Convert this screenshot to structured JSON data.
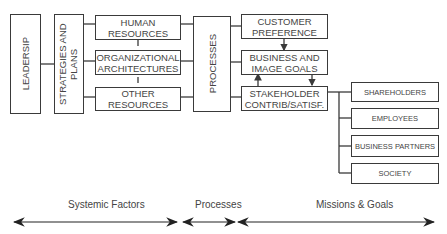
{
  "nodes": {
    "leadership": "LEADERSIP",
    "strategies": "STRATEGIES AND PLANS",
    "human_resources": "HUMAN RESOURCES",
    "org_architectures": "ORGANIZATIONAL ARCHITECTURES",
    "other_resources": "OTHER RESOURCES",
    "processes": "PROCESSES",
    "customer_preference": "CUSTOMER PREFERENCE",
    "business_goals": "BUSINESS AND IMAGE GOALS",
    "stakeholder": "STAKEHOLDER CONTRIB/SATISF.",
    "shareholders": "SHAREHOLDERS",
    "employees": "EMPLOYEES",
    "business_partners": "BUSINESS PARTNERS",
    "society": "SOCIETY"
  },
  "axis": {
    "systemic_factors": "Systemic Factors",
    "processes": "Processes",
    "missions_goals": "Missions & Goals"
  },
  "colors": {
    "line": "#3a3a3a",
    "text": "#444444"
  }
}
